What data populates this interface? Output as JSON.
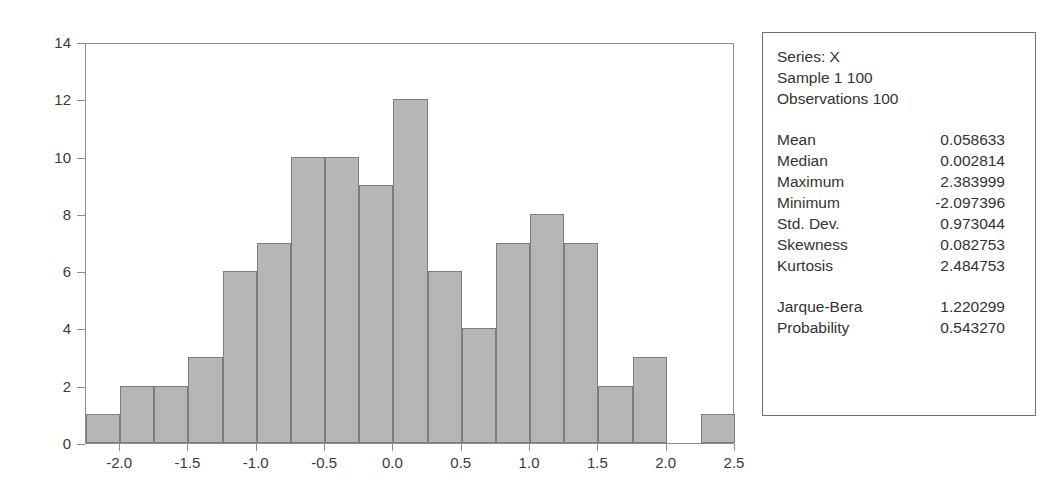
{
  "chart_data": {
    "type": "bar",
    "title": "",
    "subtitle": "",
    "xlabel": "",
    "ylabel": "",
    "xlim": [
      -2.25,
      2.5
    ],
    "ylim": [
      0,
      14
    ],
    "grid": false,
    "legend_position": "right",
    "bin_width": 0.25,
    "bin_starts": [
      -2.25,
      -2.0,
      -1.75,
      -1.5,
      -1.25,
      -1.0,
      -0.75,
      -0.5,
      -0.25,
      0.0,
      0.25,
      0.5,
      0.75,
      1.0,
      1.25,
      1.5,
      1.75,
      2.0,
      2.25
    ],
    "categories": [
      "-2.25",
      "-2.00",
      "-1.75",
      "-1.50",
      "-1.25",
      "-1.00",
      "-0.75",
      "-0.50",
      "-0.25",
      "0.00",
      "0.25",
      "0.50",
      "0.75",
      "1.00",
      "1.25",
      "1.50",
      "1.75",
      "2.00",
      "2.25"
    ],
    "values": [
      1,
      2,
      2,
      3,
      6,
      7,
      10,
      10,
      9,
      12,
      6,
      4,
      7,
      8,
      7,
      2,
      3,
      0,
      1
    ],
    "bar_color": "#b6b6b6",
    "bar_border_color": "#7d7d7d",
    "xticks": [
      -2.0,
      -1.5,
      -1.0,
      -0.5,
      0.0,
      0.5,
      1.0,
      1.5,
      2.0,
      2.5
    ],
    "xtick_labels": [
      "-2.0",
      "-1.5",
      "-1.0",
      "-0.5",
      "0.0",
      "0.5",
      "1.0",
      "1.5",
      "2.0",
      "2.5"
    ],
    "yticks": [
      0,
      2,
      4,
      6,
      8,
      10,
      12,
      14
    ],
    "ytick_labels": [
      "0",
      "2",
      "4",
      "6",
      "8",
      "10",
      "12",
      "14"
    ]
  },
  "stats_box": {
    "header": {
      "series_line": "Series: X",
      "sample_line": "Sample 1 100",
      "observations_line": "Observations 100"
    },
    "rows": [
      {
        "label": "Mean",
        "value": "0.058633"
      },
      {
        "label": "Median",
        "value": "0.002814"
      },
      {
        "label": "Maximum",
        "value": "2.383999"
      },
      {
        "label": "Minimum",
        "value": "-2.097396"
      },
      {
        "label": "Std. Dev.",
        "value": "0.973044"
      },
      {
        "label": "Skewness",
        "value": "0.082753"
      },
      {
        "label": "Kurtosis",
        "value": "2.484753"
      }
    ],
    "test_rows": [
      {
        "label": "Jarque-Bera",
        "value": "1.220299"
      },
      {
        "label": "Probability",
        "value": "0.543270"
      }
    ]
  }
}
